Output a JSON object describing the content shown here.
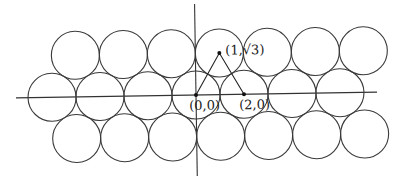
{
  "diagram": {
    "circle_radius_units": 1,
    "rows": [
      {
        "name": "top",
        "count": 7,
        "center_y_units": 1.732,
        "center_x_units": [
          -5,
          -3,
          -1,
          1,
          3,
          5,
          7
        ]
      },
      {
        "name": "middle",
        "count": 7,
        "center_y_units": 0,
        "center_x_units": [
          -6,
          -4,
          -2,
          0,
          2,
          4,
          6
        ]
      },
      {
        "name": "bottom",
        "count": 7,
        "center_y_units": -1.732,
        "center_x_units": [
          -5,
          -3,
          -1,
          1,
          3,
          5,
          7
        ]
      }
    ],
    "triangle": {
      "vertices": [
        "(0,0)",
        "(1,√3)",
        "(2,0)"
      ]
    },
    "labels": {
      "origin": "(0,0)",
      "apex": "(1,√3)",
      "right": "(2,0)"
    },
    "colors": {
      "stroke": "#3a3a3a",
      "background": "#ffffff"
    }
  }
}
